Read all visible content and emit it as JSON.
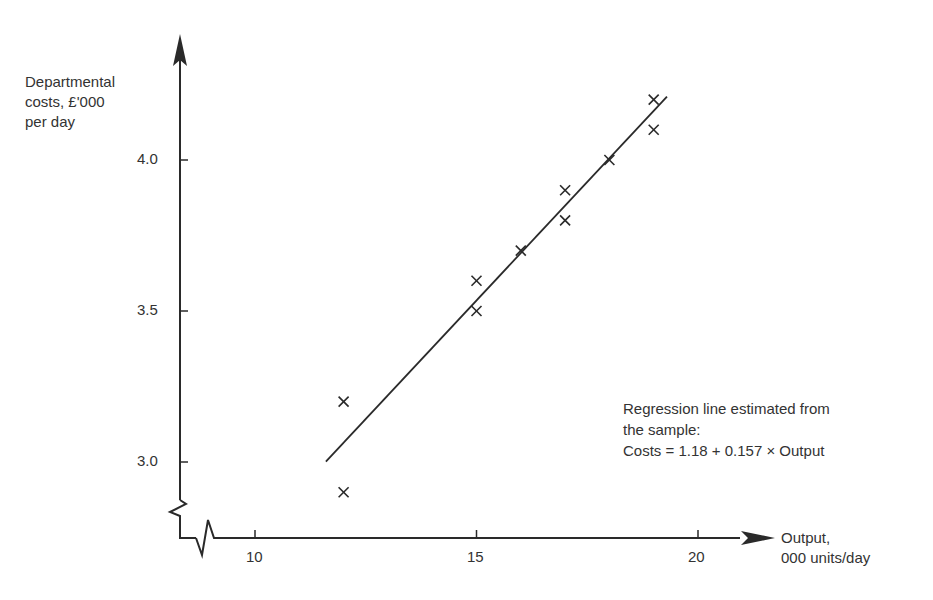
{
  "chart_data": {
    "type": "scatter",
    "title": "",
    "xlabel": "Output, 000 units/day",
    "ylabel": "Departmental costs, £'000 per day",
    "xlabel_lines": [
      "Output,",
      "000 units/day"
    ],
    "ylabel_lines": [
      "Departmental",
      "costs, £'000",
      "per day"
    ],
    "x_ticks": [
      "10",
      "15",
      "20"
    ],
    "y_ticks": [
      "3.0",
      "3.5",
      "4.0"
    ],
    "xlim": [
      8.3,
      21.5
    ],
    "ylim": [
      2.8,
      4.4
    ],
    "grid": false,
    "axis_breaks": true,
    "marker": "x",
    "series": [
      {
        "name": "Sample observations",
        "points": [
          {
            "x": 12,
            "y": 3.2
          },
          {
            "x": 12,
            "y": 2.9
          },
          {
            "x": 15,
            "y": 3.6
          },
          {
            "x": 15,
            "y": 3.5
          },
          {
            "x": 16,
            "y": 3.7
          },
          {
            "x": 17,
            "y": 3.9
          },
          {
            "x": 17,
            "y": 3.8
          },
          {
            "x": 18,
            "y": 4.0
          },
          {
            "x": 19,
            "y": 4.2
          },
          {
            "x": 19,
            "y": 4.1
          }
        ]
      }
    ],
    "regression": {
      "intercept": 1.18,
      "slope": 0.157,
      "x_range": [
        11.6,
        19.3
      ]
    },
    "annotation_lines": [
      "Regression line estimated from",
      "the sample:",
      "Costs = 1.18 + 0.157 × Output"
    ]
  },
  "colors": {
    "ink": "#2a2a2a",
    "background": "#ffffff"
  }
}
